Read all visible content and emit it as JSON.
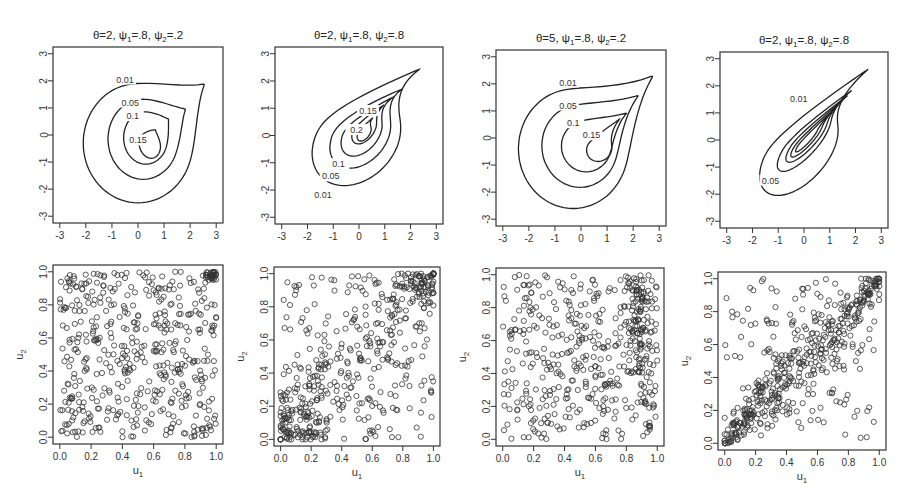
{
  "chart_data": [
    {
      "type": "contour",
      "panel": 1,
      "title": "θ=2, ψ1=.8, ψ2=.2",
      "title_parts": {
        "theta": "2",
        "psi1": ".8",
        "psi2": ".2"
      },
      "xlabel": "",
      "ylabel": "",
      "xlim": [
        -3,
        3
      ],
      "ylim": [
        -3,
        3
      ],
      "xticks": [
        -3,
        -2,
        -1,
        0,
        1,
        2,
        3
      ],
      "yticks": [
        -3,
        -2,
        -1,
        0,
        1,
        2,
        3
      ],
      "contour_levels": [
        "0.01",
        "0.05",
        "0.1",
        "0.15"
      ]
    },
    {
      "type": "contour",
      "panel": 2,
      "title": "θ=2, ψ1=.8, ψ2=.8",
      "title_parts": {
        "theta": "2",
        "psi1": ".8",
        "psi2": ".8"
      },
      "xlim": [
        -3,
        3
      ],
      "ylim": [
        -3,
        3
      ],
      "xticks": [
        -3,
        -2,
        -1,
        0,
        1,
        2,
        3
      ],
      "yticks": [
        -3,
        -2,
        -1,
        0,
        1,
        2,
        3
      ],
      "contour_levels": [
        "0.01",
        "0.05",
        "0.1",
        "0.15",
        "0.2"
      ]
    },
    {
      "type": "contour",
      "panel": 3,
      "title": "θ=5, ψ1=.8, ψ2=.2",
      "title_parts": {
        "theta": "5",
        "psi1": ".8",
        "psi2": ".2"
      },
      "xlim": [
        -3,
        3
      ],
      "ylim": [
        -3,
        3
      ],
      "xticks": [
        -3,
        -2,
        -1,
        0,
        1,
        2,
        3
      ],
      "yticks": [
        -3,
        -2,
        -1,
        0,
        1,
        2,
        3
      ],
      "contour_levels": [
        "0.01",
        "0.05",
        "0.1",
        "0.15"
      ]
    },
    {
      "type": "contour",
      "panel": 4,
      "title": "θ=2, ψ1=.8, ψ2=.8",
      "title_parts": {
        "theta": "2",
        "psi1": ".8",
        "psi2": ".8"
      },
      "xlim": [
        -3,
        3
      ],
      "ylim": [
        -3,
        3
      ],
      "xticks": [
        -3,
        -2,
        -1,
        0,
        1,
        2,
        3
      ],
      "yticks": [
        -3,
        -2,
        -1,
        0,
        1,
        2,
        3
      ],
      "contour_levels": [
        "0.01",
        "0.05"
      ]
    },
    {
      "type": "scatter",
      "panel": 5,
      "xlabel": "u1",
      "ylabel": "u2",
      "xlim": [
        0,
        1
      ],
      "ylim": [
        0,
        1
      ],
      "xticks": [
        "0.0",
        "0.2",
        "0.4",
        "0.6",
        "0.8",
        "1.0"
      ],
      "yticks": [
        "0.0",
        "0.2",
        "0.4",
        "0.6",
        "0.8",
        "1.0"
      ],
      "marker": "open-circle",
      "pattern": "weak dependence, cluster in upper-right corner (1,1)",
      "n_points_approx": 500
    },
    {
      "type": "scatter",
      "panel": 6,
      "xlabel": "u1",
      "ylabel": "u2",
      "xlim": [
        0,
        1
      ],
      "ylim": [
        0,
        1
      ],
      "xticks": [
        "0.0",
        "0.2",
        "0.4",
        "0.6",
        "0.8",
        "1.0"
      ],
      "yticks": [
        "0.0",
        "0.2",
        "0.4",
        "0.6",
        "0.8",
        "1.0"
      ],
      "marker": "open-circle",
      "pattern": "moderate positive dependence, dense at lower-left and upper-right",
      "n_points_approx": 500
    },
    {
      "type": "scatter",
      "panel": 7,
      "xlabel": "u1",
      "ylabel": "u2",
      "xlim": [
        0,
        1
      ],
      "ylim": [
        0,
        1
      ],
      "xticks": [
        "0.0",
        "0.2",
        "0.4",
        "0.6",
        "0.8",
        "1.0"
      ],
      "yticks": [
        "0.0",
        "0.2",
        "0.4",
        "0.6",
        "0.8",
        "1.0"
      ],
      "marker": "open-circle",
      "pattern": "mostly uniform, vertical band near u1≈0.85-1.0",
      "n_points_approx": 500
    },
    {
      "type": "scatter",
      "panel": 8,
      "xlabel": "u1",
      "ylabel": "u2",
      "xlim": [
        0,
        1
      ],
      "ylim": [
        0,
        1
      ],
      "xticks": [
        "0.0",
        "0.2",
        "0.4",
        "0.6",
        "0.8",
        "1.0"
      ],
      "yticks": [
        "0.0",
        "0.2",
        "0.4",
        "0.6",
        "0.8",
        "1.0"
      ],
      "marker": "open-circle",
      "pattern": "strong positive dependence along diagonal",
      "n_points_approx": 500
    }
  ],
  "labels": {
    "theta": "θ",
    "psi": "ψ",
    "u": "u",
    "sub1": "1",
    "sub2": "2"
  },
  "top_ticks": [
    "-3",
    "-2",
    "-1",
    "0",
    "1",
    "2",
    "3"
  ],
  "bottom_ticks": [
    "0.0",
    "0.2",
    "0.4",
    "0.6",
    "0.8",
    "1.0"
  ]
}
